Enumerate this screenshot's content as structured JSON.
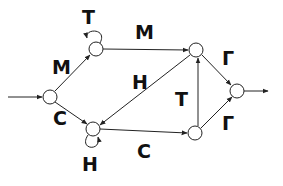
{
  "diagram": {
    "type": "state-transition-graph",
    "colors": {
      "stroke": "#222222",
      "text": "#111111",
      "background": "#ffffff"
    },
    "nodes": [
      {
        "id": "entry",
        "x": 50,
        "y": 97
      },
      {
        "id": "top-left",
        "x": 96,
        "y": 49
      },
      {
        "id": "top-right",
        "x": 196,
        "y": 50
      },
      {
        "id": "far-right",
        "x": 237,
        "y": 91
      },
      {
        "id": "bottom-left",
        "x": 93,
        "y": 129
      },
      {
        "id": "bottom-right",
        "x": 195,
        "y": 133
      }
    ],
    "labels": {
      "loop_top_left": "Т",
      "entry_to_top_left": "М",
      "top_left_to_top_right": "М",
      "top_right_to_bottom_left": "Н",
      "bottom_right_to_top_right": "Т",
      "top_right_to_far_right": "Г",
      "bottom_right_to_far_right": "Г",
      "entry_to_bottom_left": "С",
      "bottom_left_to_bottom_right": "С",
      "loop_bottom_left": "Н"
    },
    "edges": [
      {
        "from": "input",
        "to": "entry",
        "label": ""
      },
      {
        "from": "entry",
        "to": "top-left",
        "label": "М"
      },
      {
        "from": "entry",
        "to": "bottom-left",
        "label": "С"
      },
      {
        "from": "top-left",
        "to": "top-left",
        "label": "Т"
      },
      {
        "from": "top-left",
        "to": "top-right",
        "label": "М"
      },
      {
        "from": "top-right",
        "to": "bottom-left",
        "label": "Н"
      },
      {
        "from": "bottom-left",
        "to": "bottom-left",
        "label": "Н"
      },
      {
        "from": "bottom-left",
        "to": "bottom-right",
        "label": "С"
      },
      {
        "from": "bottom-right",
        "to": "top-right",
        "label": "Т"
      },
      {
        "from": "top-right",
        "to": "far-right",
        "label": "Г"
      },
      {
        "from": "bottom-right",
        "to": "far-right",
        "label": "Г"
      },
      {
        "from": "far-right",
        "to": "output",
        "label": ""
      }
    ]
  }
}
